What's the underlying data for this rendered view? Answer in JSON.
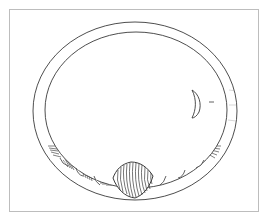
{
  "figure": {
    "colors": {
      "line": "#3a3a3a",
      "hatch": "#4a4a4a",
      "frame": "#bdbdbd",
      "background": "#ffffff"
    },
    "ring": {
      "outer": {
        "cx": 135,
        "cy": 111,
        "rx": 102,
        "ry": 89
      },
      "inner": {
        "cx": 136,
        "cy": 110,
        "rx": 91,
        "ry": 78
      }
    },
    "bead": {
      "cx": 133,
      "cy": 180,
      "w": 40,
      "h": 36
    },
    "cross_section": {
      "label": "–"
    }
  }
}
